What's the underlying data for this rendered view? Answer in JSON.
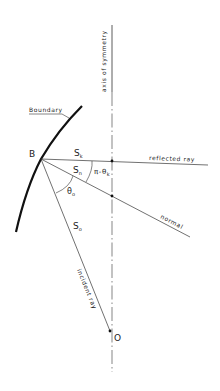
{
  "diagram": {
    "type": "ray-reflection-geometry",
    "labels": {
      "axis": "axis of symmetry",
      "boundary": "Boundary",
      "point_b": "B",
      "point_o": "O",
      "reflected_ray": "reflected  ray",
      "normal": "normal",
      "incident_ray": "incident  ray",
      "s_k": "S",
      "s_k_sub": "k",
      "s_n": "S",
      "s_n_sub": "n",
      "s_o": "S",
      "s_o_sub": "o",
      "theta_o": "θ",
      "theta_o_sub": "o",
      "pi_minus_theta_k": "π-θ",
      "pi_minus_theta_k_sub": "k"
    },
    "colors": {
      "line": "#333333",
      "boundary": "#111111",
      "background": "#ffffff"
    }
  }
}
